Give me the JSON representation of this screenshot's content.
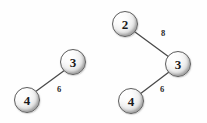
{
  "diagram": {
    "background_color": "#fefefe",
    "node_fill_color": "#e8e8e8",
    "node_border_color": "#5d5d5d",
    "edge_color": "#4a4a4a",
    "label_color": "#1a1a1a"
  },
  "graphs": [
    {
      "name": "left-graph",
      "nodes": [
        {
          "id": "left-node-3",
          "label": "3",
          "cx": 73,
          "cy": 62
        },
        {
          "id": "left-node-4",
          "label": "4",
          "cx": 27,
          "cy": 100
        }
      ],
      "edges": [
        {
          "id": "left-edge-4-3",
          "from": "4",
          "to": "3",
          "weight": "6",
          "x1": 35,
          "y1": 92,
          "x2": 65,
          "y2": 70,
          "label_x": 59,
          "label_y": 89
        }
      ]
    },
    {
      "name": "right-graph",
      "nodes": [
        {
          "id": "right-node-2",
          "label": "2",
          "cx": 125,
          "cy": 24
        },
        {
          "id": "right-node-3",
          "label": "3",
          "cx": 178,
          "cy": 64
        },
        {
          "id": "right-node-4",
          "label": "4",
          "cx": 131,
          "cy": 101
        }
      ],
      "edges": [
        {
          "id": "right-edge-2-3",
          "from": "2",
          "to": "3",
          "weight": "8",
          "x1": 135,
          "y1": 32,
          "x2": 169,
          "y2": 57,
          "label_x": 163,
          "label_y": 33
        },
        {
          "id": "right-edge-4-3",
          "from": "4",
          "to": "3",
          "weight": "6",
          "x1": 140,
          "y1": 94,
          "x2": 169,
          "y2": 72,
          "label_x": 162,
          "label_y": 89
        }
      ]
    }
  ]
}
